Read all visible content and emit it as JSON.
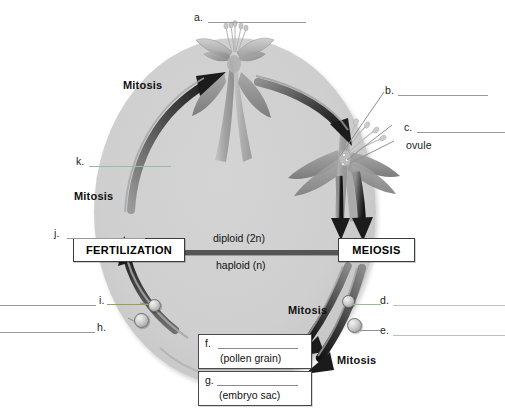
{
  "diagram": {
    "oval_label": "life-cycle-oval"
  },
  "stage_boxes": [
    {
      "id": "fertilization",
      "label": "FERTILIZATION"
    },
    {
      "id": "meiosis",
      "label": "MEIOSIS"
    }
  ],
  "ploidy": {
    "upper": "diploid (2n)",
    "lower": "haploid (n)"
  },
  "mitosis_labels": [
    {
      "id": "mitosis-top-left",
      "label": "Mitosis"
    },
    {
      "id": "mitosis-mid-left",
      "label": "Mitosis"
    },
    {
      "id": "mitosis-mid-right",
      "label": "Mitosis"
    },
    {
      "id": "mitosis-bottom-right",
      "label": "Mitosis"
    }
  ],
  "blank_labels": [
    {
      "id": "a",
      "letter": "a.",
      "answer": ""
    },
    {
      "id": "b",
      "letter": "b.",
      "answer": ""
    },
    {
      "id": "c",
      "letter": "c.",
      "answer": ""
    },
    {
      "id": "d",
      "letter": "d.",
      "answer": ""
    },
    {
      "id": "e",
      "letter": "e.",
      "answer": ""
    },
    {
      "id": "h",
      "letter": "h.",
      "answer": ""
    },
    {
      "id": "i",
      "letter": "i.",
      "answer": ""
    },
    {
      "id": "j",
      "letter": "j.",
      "answer": ""
    },
    {
      "id": "k",
      "letter": "k.",
      "answer": ""
    }
  ],
  "named_labels": [
    {
      "id": "ovule",
      "label": "ovule"
    }
  ],
  "answer_boxes": [
    {
      "id": "f",
      "letter": "f.",
      "answer": "",
      "hint": "(pollen grain)"
    },
    {
      "id": "g",
      "letter": "g.",
      "answer": "",
      "hint": "(embryo sac)"
    }
  ],
  "colors": {
    "oval_fill": "#cfcfcf",
    "blank_line": "#b9bcd2",
    "arrow_dark": "#2b2b2b",
    "bar": "#555555",
    "text": "#111111"
  }
}
